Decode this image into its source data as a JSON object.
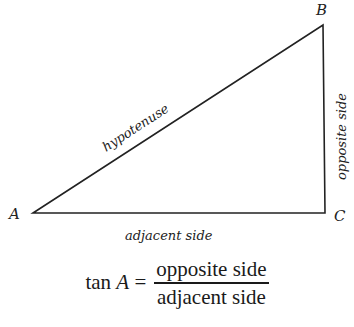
{
  "diagram": {
    "type": "right-triangle",
    "vertices": {
      "A": {
        "label": "A",
        "x": 33,
        "y": 213
      },
      "B": {
        "label": "B",
        "x": 323,
        "y": 25
      },
      "C": {
        "label": "C",
        "x": 325,
        "y": 213
      }
    },
    "sides": {
      "hypotenuse": {
        "label": "hypotenuse"
      },
      "opposite": {
        "label": "opposite side"
      },
      "adjacent": {
        "label": "adjacent side"
      }
    },
    "stroke_color": "#222222"
  },
  "formula": {
    "func": "tan",
    "var": "A",
    "equals": "=",
    "numerator": "opposite side",
    "denominator": "adjacent side"
  }
}
